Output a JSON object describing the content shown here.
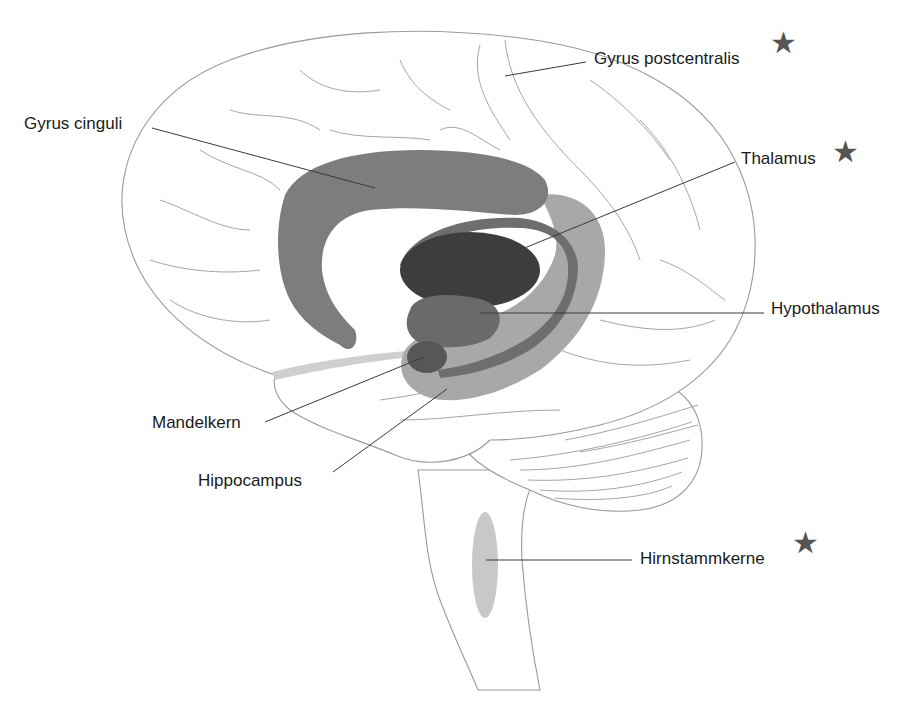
{
  "diagram": {
    "colors": {
      "cingulate": "#7d7d7d",
      "fornix": "#6e6e6e",
      "thalamus": "#3d3d3d",
      "hypothalamus": "#6a6a6a",
      "hippocampus": "#a8a8a8",
      "amygdala": "#575757",
      "olfactory": "#cfcfcf",
      "brainstem_nuclei": "#c8c8c8",
      "star": "#555555",
      "outline": "#9a9a9a"
    },
    "labels": [
      {
        "id": "gyrus-postcentralis",
        "text": "Gyrus postcentralis",
        "x": 594,
        "y": 52,
        "star": true,
        "line": [
          505,
          76,
          586,
          62
        ]
      },
      {
        "id": "gyrus-cinguli",
        "text": "Gyrus cinguli",
        "x": 24,
        "y": 117,
        "star": false,
        "line": [
          152,
          128,
          375,
          188
        ]
      },
      {
        "id": "thalamus",
        "text": "Thalamus",
        "x": 741,
        "y": 152,
        "star": true,
        "line": [
          505,
          256,
          735,
          162
        ]
      },
      {
        "id": "hypothalamus",
        "text": "Hypothalamus",
        "x": 771,
        "y": 302,
        "star": false,
        "line": [
          480,
          313,
          764,
          313
        ]
      },
      {
        "id": "mandelkern",
        "text": "Mandelkern",
        "x": 152,
        "y": 416,
        "star": false,
        "line": [
          265,
          422,
          424,
          357
        ]
      },
      {
        "id": "hippocampus",
        "text": "Hippocampus",
        "x": 198,
        "y": 474,
        "star": false,
        "line": [
          333,
          472,
          447,
          389
        ]
      },
      {
        "id": "hirnstammkerne",
        "text": "Hirnstammkerne",
        "x": 640,
        "y": 552,
        "star": true,
        "line": [
          486,
          560,
          632,
          560
        ]
      }
    ],
    "star_glyph": "★"
  }
}
